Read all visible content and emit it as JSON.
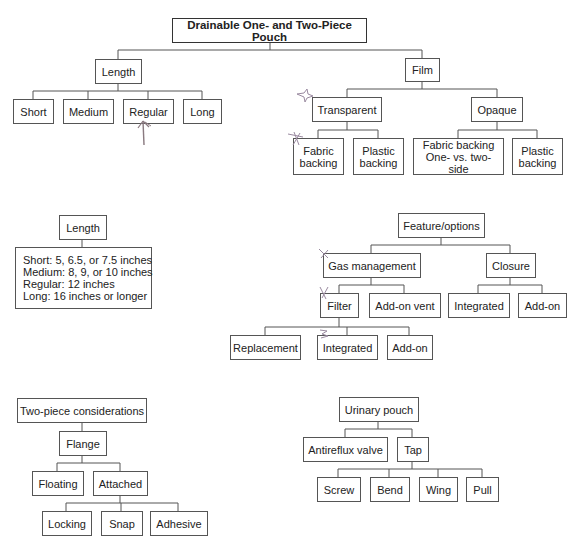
{
  "diagram": {
    "title": "Drainable One- and Two-Piece Pouch",
    "length_branch": {
      "label": "Length",
      "children": [
        "Short",
        "Medium",
        "Regular",
        "Long"
      ]
    },
    "film_branch": {
      "label": "Film",
      "transparent": {
        "label": "Transparent",
        "children": [
          "Fabric backing",
          "Plastic backing"
        ]
      },
      "opaque": {
        "label": "Opaque",
        "children": [
          "Fabric backing One- vs. two-side",
          "Plastic backing"
        ]
      }
    }
  },
  "length_detail": {
    "label": "Length",
    "lines": [
      "Short: 5, 6.5, or 7.5 inches",
      "Medium: 8, 9, or 10 inches",
      "Regular: 12 inches",
      "Long: 16 inches or longer"
    ]
  },
  "features": {
    "label": "Feature/options",
    "gas_management": {
      "label": "Gas management",
      "filter": {
        "label": "Filter",
        "children": [
          "Replacement",
          "Integrated",
          "Add-on"
        ]
      },
      "addon_vent": "Add-on vent"
    },
    "closure": {
      "label": "Closure",
      "children": [
        "Integrated",
        "Add-on"
      ]
    }
  },
  "two_piece": {
    "label": "Two-piece considerations",
    "flange": {
      "label": "Flange",
      "floating": "Floating",
      "attached": {
        "label": "Attached",
        "children": [
          "Locking",
          "Snap",
          "Adhesive"
        ]
      }
    }
  },
  "urinary": {
    "label": "Urinary pouch",
    "antireflux": "Antireflux valve",
    "tap": {
      "label": "Tap",
      "children": [
        "Screw",
        "Bend",
        "Wing",
        "Pull"
      ]
    }
  },
  "annotations": {
    "arrow_color": "#8a7a80",
    "mark_color": "#9a8aa0"
  }
}
